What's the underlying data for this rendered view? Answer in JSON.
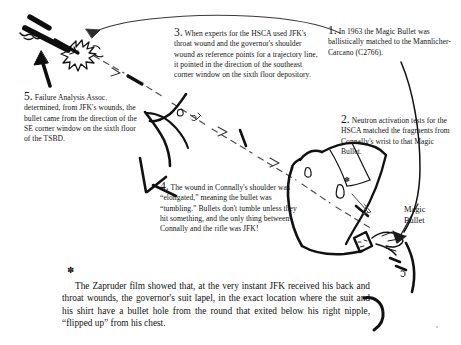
{
  "document": {
    "title": "Magic Bullet trajectory annotated diagram",
    "background_color": "#ffffff",
    "ink_color": "#141414"
  },
  "notes": [
    {
      "id": "note1",
      "number": "1.",
      "text": "In 1963 the  Magic Bullet was ballistically matched to the Mannlicher-Carcano (C2766)."
    },
    {
      "id": "note2",
      "number": "2.",
      "text": "Neutron activation tests for the HSCA matched the fragments from Connally's wrist to that Magic Bullet."
    },
    {
      "id": "note3",
      "number": "3.",
      "text": "When experts for the HSCA used JFK's throat wound and the governor's shoulder wound as reference points for a trajectory line, it pointed in the direction of the southeast corner window on the sixth floor depository."
    },
    {
      "id": "note4",
      "number": "4.",
      "text": "The wound in Connally's shoulder was “elongated,” meaning the bullet was “tumbling.” Bullets don't tumble unless they hit something, and the only thing between Connally and the rifle was JFK!"
    },
    {
      "id": "note5",
      "number": "5.",
      "text": "Failure Analysis Assoc. determined, from JFK's wounds, the bullet came from the direction of the SE corner window on the sixth floor of the TSBD."
    }
  ],
  "footnote": {
    "marker": "✽",
    "text": "The Zapruder film showed that, at the very instant JFK received his back and throat wounds, the governor's suit lapel, in the exact location where the suit and his shirt have a bullet hole from the round that exited below his right nipple, “flipped up” from his chest."
  },
  "labels": {
    "magic_bullet": {
      "line1": "Magic",
      "line2": "Bullet"
    }
  },
  "markers": {
    "arm_star": "✽",
    "footnote_star": "✽"
  },
  "artwork": {
    "rifle": "rifle muzzle with muzzle flash, upper left",
    "curved_arrow": "long curved arrow sweeping right-to-left toward the rifle",
    "up_arrow": "solid black arrow pointing up-right at the rifle",
    "trajectory": "dashed bullet trajectory line with arrowheads running from rifle down to the right",
    "jfk_figure": "JFK head and shoulder outline, center",
    "connally_figure": "Connally torso, arm and wrist outline, right",
    "wrist_hit": "bullet fragments entering Connally's wrist",
    "bullet_arrow": "arrow from Magic Bullet label to the wrist"
  }
}
